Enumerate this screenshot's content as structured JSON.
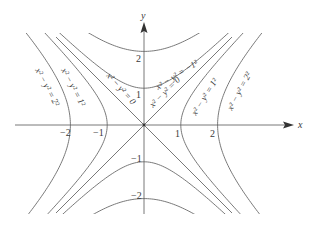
{
  "diagram": {
    "axes": {
      "x_label": "x",
      "y_label": "y",
      "x_ticks": [
        {
          "value": -2,
          "label": "−2"
        },
        {
          "value": -1,
          "label": "−1"
        },
        {
          "value": 1,
          "label": "1"
        },
        {
          "value": 2,
          "label": "2"
        }
      ],
      "y_ticks": [
        {
          "value": 2,
          "label": "2"
        },
        {
          "value": 1,
          "label": "1"
        },
        {
          "value": -1,
          "label": "−1"
        },
        {
          "value": -2,
          "label": "−2"
        }
      ]
    },
    "level_curves": [
      {
        "k": -4,
        "equation": "x² − y² = −1²",
        "note": "vertical hyperbola branch label shown for k=-1"
      },
      {
        "k": -1,
        "equation": "x² − y² = −1²"
      },
      {
        "k": 0,
        "equation": "x² − y² = 0"
      },
      {
        "k": 1,
        "equation": "x² − y² = 1²"
      },
      {
        "k": 4,
        "equation": "x² − y² = 2²"
      }
    ],
    "labels": {
      "left_outer": "x² − y² = 2²",
      "left_inner": "x² − y² = 1²",
      "left_zero": "x² − y² = 0",
      "top_neg": "x² − y² = −1²",
      "right_zero": "x² − y² = 0",
      "right_inner": "x² − y² = 1²",
      "right_outer": "x² − y² = 2²"
    },
    "colors": {
      "curve": "#6a6a6a",
      "text": "#3a3a3a",
      "background": "#ffffff"
    }
  }
}
